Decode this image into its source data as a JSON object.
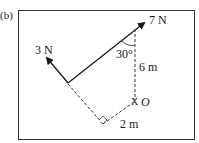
{
  "figure": {
    "label": "(b)",
    "forces": [
      {
        "name": "force-7N",
        "label": "7 N",
        "magnitude_N": 7
      },
      {
        "name": "force-3N",
        "label": "3 N",
        "magnitude_N": 3
      }
    ],
    "angle_label": "30°",
    "angle_deg": 30,
    "distances": [
      {
        "name": "vertical-distance",
        "label": "6 m",
        "value_m": 6
      },
      {
        "name": "perpendicular-distance",
        "label": "2 m",
        "value_m": 2
      }
    ],
    "pivot_label": "O",
    "pivot_marker": "X"
  }
}
